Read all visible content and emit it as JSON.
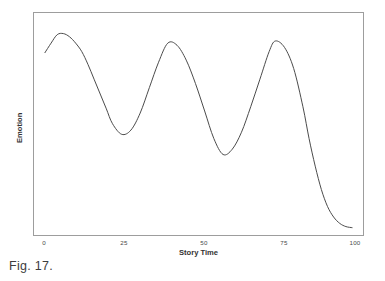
{
  "figure": {
    "caption": "Fig. 17."
  },
  "chart_data": {
    "type": "line",
    "title": "",
    "subtitle": "",
    "xlabel": "Story Time",
    "ylabel": "Emotion",
    "xlim": [
      0,
      100
    ],
    "ylim": [
      0,
      1
    ],
    "grid": false,
    "legend": false,
    "legend_position": "none",
    "xticks": [
      0,
      25,
      50,
      75,
      100
    ],
    "xtick_labels": [
      "0",
      "25",
      "50",
      "75",
      "100"
    ],
    "yticks": [],
    "ytick_labels": [],
    "annotations": [],
    "line_color": "#4a4a4a",
    "line_width": 1.0,
    "series": [
      {
        "name": "Emotion",
        "x": [
          0,
          2,
          4,
          6,
          8,
          10,
          12,
          14,
          16,
          18,
          20,
          22,
          25,
          28,
          31,
          34,
          37,
          40,
          43,
          46,
          49,
          52,
          55,
          58,
          61,
          64,
          67,
          70,
          73,
          75,
          78,
          81,
          84,
          86,
          88,
          90,
          92,
          94,
          96,
          98,
          100
        ],
        "values": [
          0.855,
          0.9,
          0.94,
          0.945,
          0.93,
          0.9,
          0.86,
          0.8,
          0.73,
          0.66,
          0.59,
          0.52,
          0.47,
          0.49,
          0.57,
          0.69,
          0.81,
          0.9,
          0.89,
          0.82,
          0.71,
          0.58,
          0.45,
          0.375,
          0.4,
          0.48,
          0.6,
          0.73,
          0.86,
          0.91,
          0.88,
          0.78,
          0.6,
          0.45,
          0.32,
          0.21,
          0.13,
          0.08,
          0.05,
          0.035,
          0.03
        ]
      }
    ],
    "features": {
      "peaks": [
        {
          "x": 5,
          "y": 0.945
        },
        {
          "x": 40,
          "y": 0.9
        },
        {
          "x": 75,
          "y": 0.91
        }
      ],
      "troughs": [
        {
          "x": 25,
          "y": 0.47
        },
        {
          "x": 58,
          "y": 0.375
        }
      ],
      "end_plateau": {
        "x_start": 95,
        "y": 0.03
      }
    }
  }
}
